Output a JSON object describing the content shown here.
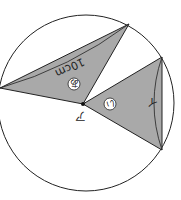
{
  "diagram": {
    "circle": {
      "cx": 86,
      "cy": 103,
      "r": 88
    },
    "colors": {
      "shade": "#a9a9a9",
      "stroke": "#222222",
      "background": "#ffffff"
    },
    "point_label": "ア",
    "length_label": "10cm",
    "region_label_1": "あ",
    "region_label_2": "い",
    "arc_label": "イ"
  }
}
